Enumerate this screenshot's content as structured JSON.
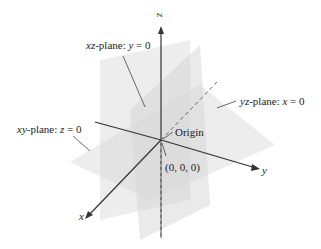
{
  "diagram": {
    "axes": {
      "x": "x",
      "y": "y",
      "z": "z"
    },
    "labels": {
      "xz_plane": {
        "name_italic": "xz",
        "name_rest": "-plane: ",
        "var": "y",
        "eq": " = 0"
      },
      "yz_plane": {
        "name_italic": "yz",
        "name_rest": "-plane: ",
        "var": "x",
        "eq": " = 0"
      },
      "xy_plane": {
        "name_italic": "xy",
        "name_rest": "-plane: ",
        "var": "z",
        "eq": " = 0"
      },
      "origin": "Origin",
      "origin_coords": "(0, 0, 0)"
    },
    "colors": {
      "plane_fill": "#d8d8d8",
      "axis": "#333333",
      "text": "#222222"
    }
  }
}
